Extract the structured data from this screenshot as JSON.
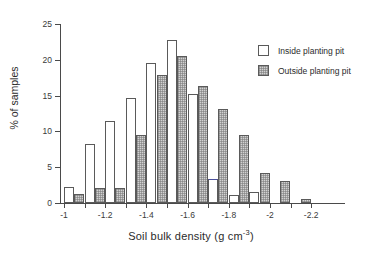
{
  "chart_data": {
    "type": "bar",
    "title": "",
    "subtitle": "",
    "xlabel": "Soil bulk density (g cm-3)",
    "xlabel_base": "Soil bulk density (g cm",
    "xlabel_sup": "-3",
    "xlabel_tail": ")",
    "ylabel": "% of samples",
    "ylim": [
      0,
      25
    ],
    "xlim": [
      -0.95,
      -2.25
    ],
    "grid": false,
    "legend_position": "top-right",
    "y_ticks": [
      0,
      5,
      10,
      15,
      20,
      25
    ],
    "y_tick_labels": [
      "0",
      "5",
      "10",
      "15",
      "20",
      "25"
    ],
    "x_ticks": [
      -1.0,
      -1.1,
      -1.2,
      -1.3,
      -1.4,
      -1.5,
      -1.6,
      -1.7,
      -1.8,
      -1.9,
      -2.0,
      -2.1,
      -2.2
    ],
    "x_tick_labels": [
      "-1",
      "",
      "-1.2",
      "",
      "-1.4",
      "",
      "-1.6",
      "",
      "-1.8",
      "",
      "-2",
      "",
      "-2.2"
    ],
    "x_major_labels": [
      "-1",
      "-1.2",
      "-1.4",
      "-1.6",
      "-1.8",
      "-2",
      "-2.2"
    ],
    "x_major_positions": [
      -1.0,
      -1.2,
      -1.4,
      -1.6,
      -1.8,
      -2.0,
      -2.2
    ],
    "categories": [
      "-1.0",
      "-1.1",
      "-1.2",
      "-1.3",
      "-1.4",
      "-1.5",
      "-1.6",
      "-1.7",
      "-1.8",
      "-1.9",
      "-2.0",
      "-2.1"
    ],
    "series": [
      {
        "name": "Inside planting pit",
        "color": "#ffffff",
        "values": [
          2.2,
          8.2,
          11.4,
          14.7,
          19.6,
          22.8,
          15.2,
          3.3,
          1.1,
          1.6,
          0.0,
          0.0
        ]
      },
      {
        "name": "Outside planting pit",
        "color": "#d2d2d2",
        "values": [
          1.2,
          2.1,
          2.1,
          9.5,
          17.9,
          20.5,
          16.4,
          13.2,
          9.5,
          4.2,
          3.1,
          0.5
        ]
      }
    ],
    "annotations": [
      {
        "note": "Inside-pit bar at -1.7 bin is drawn with a blue top edge",
        "bin": "-1.7",
        "series": "Inside planting pit"
      }
    ]
  },
  "legend": {
    "items": [
      {
        "label": "Inside planting pit",
        "swatch": "white-square-icon"
      },
      {
        "label": "Outside planting pit",
        "swatch": "hatched-square-icon"
      }
    ]
  }
}
